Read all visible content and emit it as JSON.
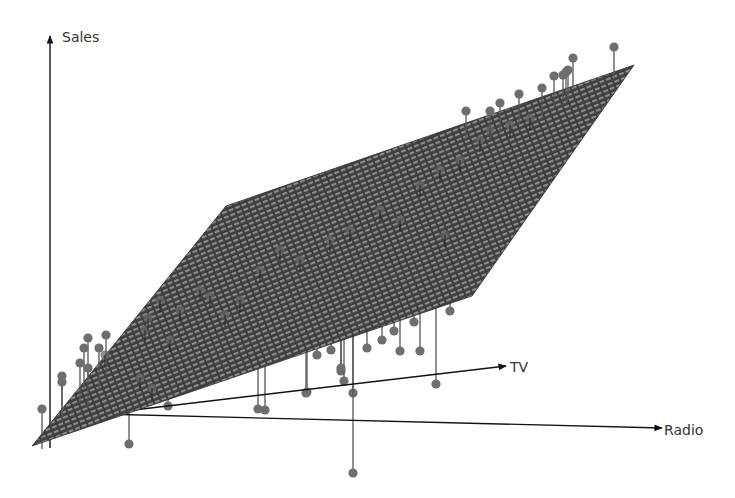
{
  "chart_data": {
    "type": "scatter3d_with_regression_plane",
    "title": "",
    "axes": {
      "z": {
        "label": "Sales"
      },
      "x": {
        "label": "TV"
      },
      "y": {
        "label": "Radio"
      }
    },
    "grid": false,
    "legend": null,
    "plane": {
      "description": "Least squares regression plane of Sales on TV and Radio",
      "fill_color": "#4a4a4a",
      "hatch_color": "#8a8a8a",
      "corners_px": [
        [
          32,
          446
        ],
        [
          226,
          206
        ],
        [
          634,
          65
        ],
        [
          472,
          296
        ]
      ]
    },
    "points": {
      "color": "#6e6e6e",
      "stem_color": "#555555",
      "note": "Observations with vertical residual lines to the plane; points above plane drawn over it, points below drawn beneath it",
      "above_plane_px": [
        [
          614,
          47
        ],
        [
          573,
          58
        ],
        [
          568,
          70
        ],
        [
          566,
          72
        ],
        [
          563,
          75
        ],
        [
          542,
          88
        ],
        [
          519,
          94
        ],
        [
          500,
          103
        ],
        [
          490,
          111
        ],
        [
          466,
          111
        ],
        [
          554,
          76
        ],
        [
          88,
          338
        ],
        [
          84,
          348
        ],
        [
          99,
          348
        ],
        [
          80,
          363
        ],
        [
          88,
          368
        ],
        [
          106,
          335
        ],
        [
          62,
          376
        ],
        [
          62,
          382
        ],
        [
          42,
          409
        ]
      ],
      "below_plane_px": [
        [
          168,
          406
        ],
        [
          129,
          444
        ],
        [
          317,
          355
        ],
        [
          331,
          350
        ],
        [
          367,
          348
        ],
        [
          382,
          340
        ],
        [
          394,
          331
        ],
        [
          400,
          351
        ],
        [
          414,
          322
        ],
        [
          420,
          351
        ],
        [
          436,
          384
        ],
        [
          450,
          311
        ],
        [
          486,
          259
        ],
        [
          341,
          371
        ],
        [
          344,
          381
        ],
        [
          353,
          393
        ],
        [
          353,
          473
        ],
        [
          341,
          368
        ],
        [
          258,
          409
        ],
        [
          265,
          410
        ],
        [
          306,
          393
        ],
        [
          307,
          392
        ]
      ],
      "on_plane_px": [
        [
          105,
          355
        ],
        [
          145,
          330
        ],
        [
          148,
          318
        ],
        [
          160,
          300
        ],
        [
          170,
          340
        ],
        [
          180,
          310
        ],
        [
          200,
          290
        ],
        [
          210,
          296
        ],
        [
          225,
          315
        ],
        [
          240,
          300
        ],
        [
          260,
          270
        ],
        [
          280,
          250
        ],
        [
          300,
          260
        ],
        [
          330,
          240
        ],
        [
          350,
          230
        ],
        [
          380,
          210
        ],
        [
          400,
          220
        ],
        [
          420,
          185
        ],
        [
          440,
          170
        ],
        [
          460,
          160
        ],
        [
          480,
          140
        ],
        [
          490,
          130
        ],
        [
          510,
          125
        ],
        [
          530,
          118
        ],
        [
          445,
          235
        ],
        [
          140,
          378
        ],
        [
          152,
          388
        ]
      ]
    }
  }
}
